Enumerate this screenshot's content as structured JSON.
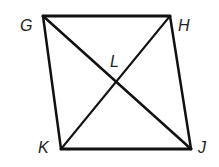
{
  "diagram": {
    "type": "quadrilateral-with-diagonals",
    "vertices": {
      "G": {
        "label": "G",
        "x": 43,
        "y": 16
      },
      "H": {
        "label": "H",
        "x": 170,
        "y": 16
      },
      "J": {
        "label": "J",
        "x": 191,
        "y": 149
      },
      "K": {
        "label": "K",
        "x": 61,
        "y": 149
      }
    },
    "intersection": {
      "label": "L",
      "x": 117,
      "y": 82
    },
    "sides": [
      "GH",
      "HJ",
      "JK",
      "KG"
    ],
    "diagonals": [
      "GJ",
      "HK"
    ],
    "stroke_color": "#111111"
  }
}
